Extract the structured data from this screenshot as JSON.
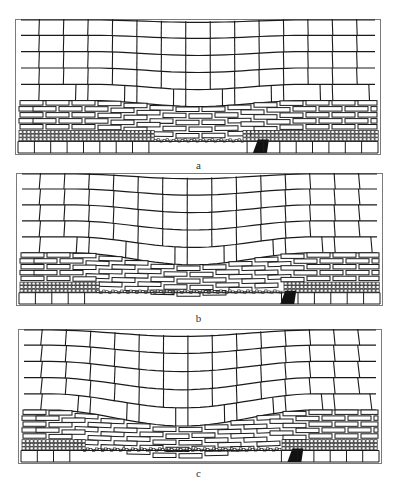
{
  "figure": {
    "background": "#ffffff",
    "line_color": "#1a1a1a",
    "frame_color": "#7a7a7a",
    "panels": [
      {
        "id": "a",
        "caption": "a",
        "box": {
          "x": 15,
          "y": 19,
          "w": 366,
          "h": 136
        },
        "caption_y": 159,
        "max_subsidence": 6,
        "sag_center": 0.5,
        "sag_halfwidth": 0.3,
        "caved_from": 0.38,
        "caved_to": 0.62,
        "dark_zone_x": 0.65,
        "column_offsets": [
          0,
          0,
          0,
          0,
          0,
          3,
          3,
          3,
          3,
          3,
          3,
          3,
          0,
          0,
          0
        ],
        "rotated_block_left": 0.0,
        "rotated_block_right": 0.0
      },
      {
        "id": "b",
        "caption": "b",
        "box": {
          "x": 16,
          "y": 173,
          "w": 367,
          "h": 133
        },
        "caption_y": 312,
        "max_subsidence": 12,
        "sag_center": 0.48,
        "sag_halfwidth": 0.34,
        "caved_from": 0.22,
        "caved_to": 0.72,
        "dark_zone_x": 0.72,
        "column_offsets": [
          0,
          0,
          0,
          0,
          8,
          12,
          14,
          15,
          14,
          12,
          9,
          6,
          0,
          0,
          0
        ],
        "rotated_block_left": 0.22,
        "rotated_block_right": 0.0
      },
      {
        "id": "c",
        "caption": "c",
        "box": {
          "x": 18,
          "y": 329,
          "w": 364,
          "h": 135
        },
        "caption_y": 467,
        "max_subsidence": 16,
        "sag_center": 0.45,
        "sag_halfwidth": 0.38,
        "caved_from": 0.18,
        "caved_to": 0.72,
        "dark_zone_x": 0.74,
        "column_offsets": [
          0,
          0,
          0,
          0,
          10,
          16,
          18,
          18,
          16,
          12,
          8,
          4,
          0,
          0,
          0
        ],
        "rotated_block_left": 0.2,
        "rotated_block_right": 0.0
      }
    ],
    "layers": {
      "big_block_rows": 5,
      "big_block_cols": 15,
      "brick_rows": 5,
      "brick_width": 26,
      "coal_rows": 3,
      "floor_cells": 22
    }
  }
}
